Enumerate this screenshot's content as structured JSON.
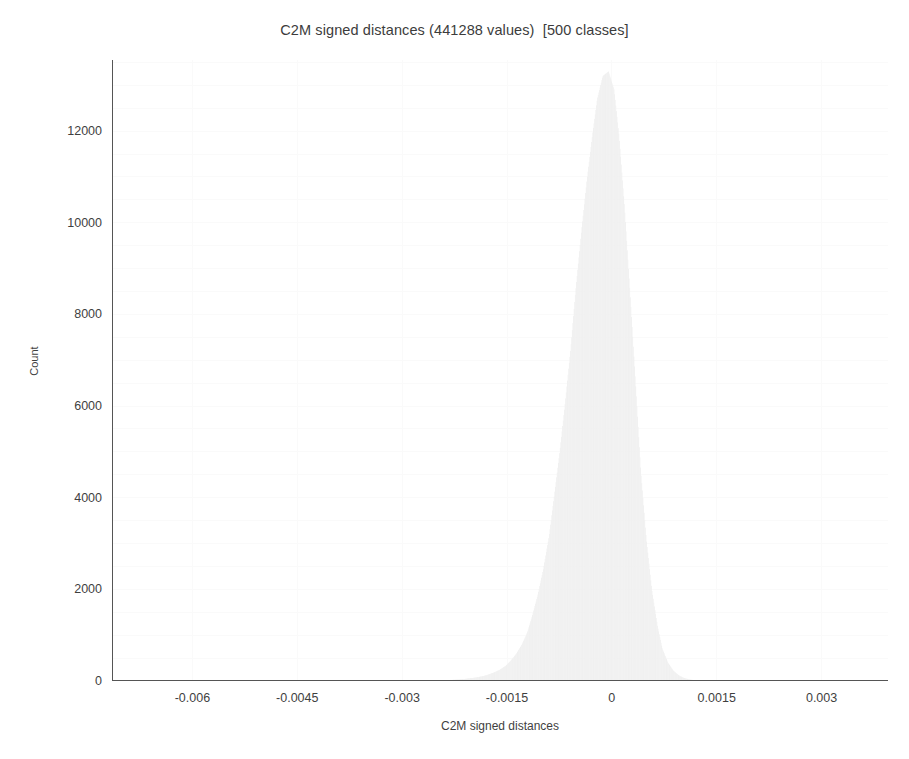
{
  "chart_data": {
    "type": "bar",
    "title": "C2M signed distances (441288 values)  [500 classes]",
    "xlabel": "C2M signed distances",
    "ylabel": "Count",
    "total_values": 441288,
    "num_classes": 500,
    "grid": true,
    "legend": "none",
    "xlim": [
      -0.00715,
      0.00395
    ],
    "ylim": [
      0,
      13550
    ],
    "xtick_labels": [
      "-0.006",
      "-0.0045",
      "-0.003",
      "-0.0015",
      "0",
      "0.0015",
      "0.003"
    ],
    "xtick_values": [
      -0.006,
      -0.0045,
      -0.003,
      -0.0015,
      0,
      0.0015,
      0.003
    ],
    "xtick_minor_step": 0.0003,
    "ytick_labels": [
      "0",
      "2000",
      "4000",
      "6000",
      "8000",
      "10000",
      "12000"
    ],
    "ytick_values": [
      0,
      2000,
      4000,
      6000,
      8000,
      10000,
      12000
    ],
    "ytick_minor_step": 500,
    "bar_color": "#f0f0f0",
    "bin_width": 2.22e-05,
    "peak_value": 13300,
    "peak_x": -0.00031,
    "x": [
      -0.003,
      -0.00292,
      -0.00284,
      -0.00276,
      -0.00269,
      -0.00261,
      -0.00253,
      -0.00245,
      -0.00238,
      -0.0023,
      -0.00222,
      -0.00214,
      -0.00207,
      -0.00199,
      -0.00191,
      -0.00183,
      -0.00176,
      -0.00168,
      -0.0016,
      -0.00152,
      -0.00145,
      -0.00137,
      -0.00129,
      -0.00121,
      -0.00114,
      -0.00106,
      -0.00098,
      -0.0009,
      -0.00083,
      -0.00075,
      -0.00067,
      -0.00059,
      -0.00052,
      -0.00044,
      -0.00036,
      -0.00028,
      -0.00021,
      -0.00013,
      -5e-05,
      3e-05,
      0.0001,
      0.00018,
      0.00026,
      0.00034,
      0.00041,
      0.00049,
      0.00057,
      0.00065,
      0.00072,
      0.0008,
      0.00088,
      0.00096,
      0.00103,
      0.00111,
      0.00119,
      0.00127
    ],
    "values": [
      2,
      3,
      4,
      5,
      7,
      9,
      12,
      15,
      19,
      24,
      31,
      40,
      52,
      67,
      86,
      112,
      145,
      190,
      250,
      330,
      440,
      590,
      790,
      1060,
      1420,
      1880,
      2450,
      3150,
      3980,
      4950,
      6050,
      7250,
      8500,
      9750,
      10900,
      11900,
      12700,
      13200,
      13300,
      12900,
      11900,
      10300,
      8400,
      6400,
      4600,
      3100,
      1980,
      1200,
      700,
      400,
      220,
      120,
      65,
      34,
      17,
      8
    ]
  }
}
